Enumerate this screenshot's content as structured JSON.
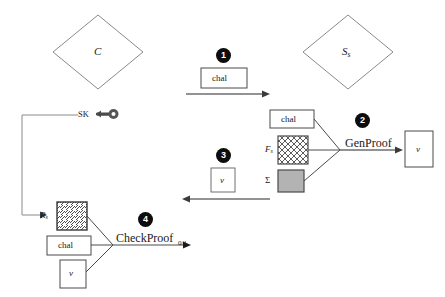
{
  "diagram": {
    "colors": {
      "line": "#6e6e6e",
      "dark_line": "#3a3a3a",
      "marker_fill": "#0d0d0d",
      "marker_text": "#ffffff",
      "box_fill": "#ffffff",
      "sigma_fill": "#b3b3b3",
      "text": "#1a1a1a"
    },
    "actors": [
      {
        "id": "client",
        "label": "C",
        "shape": "diamond"
      },
      {
        "id": "server",
        "label": "S",
        "sublabel": "s",
        "shape": "diamond"
      }
    ],
    "markers": [
      {
        "id": "marker-1",
        "number": "1"
      },
      {
        "id": "marker-2",
        "number": "2"
      },
      {
        "id": "marker-3",
        "number": "3"
      },
      {
        "id": "marker-4",
        "number": "4"
      }
    ],
    "key": {
      "label": "SK",
      "icon": "key-icon"
    },
    "step1": {
      "box_label": "chal",
      "direction": "right"
    },
    "step2": {
      "process_label": "GenProof",
      "inputs": [
        {
          "id": "chal",
          "label": "chal",
          "fill": "plain"
        },
        {
          "id": "fs",
          "label": "F",
          "sublabel": "s",
          "fill": "crosshatch"
        },
        {
          "id": "sigma",
          "label": "Σ",
          "fill": "solid-gray"
        }
      ],
      "output": {
        "id": "v",
        "label": "v"
      }
    },
    "step3": {
      "box_label": "v",
      "direction": "left"
    },
    "step4": {
      "process_label": "CheckProof",
      "inputs": [
        {
          "id": "rs",
          "label": "R",
          "sublabel": "s",
          "fill": "diagonal-hatch"
        },
        {
          "id": "chal",
          "label": "chal",
          "fill": "plain"
        },
        {
          "id": "v",
          "label": "v",
          "fill": "plain"
        }
      ],
      "output": {
        "id": "result",
        "label": "0/1"
      }
    }
  }
}
